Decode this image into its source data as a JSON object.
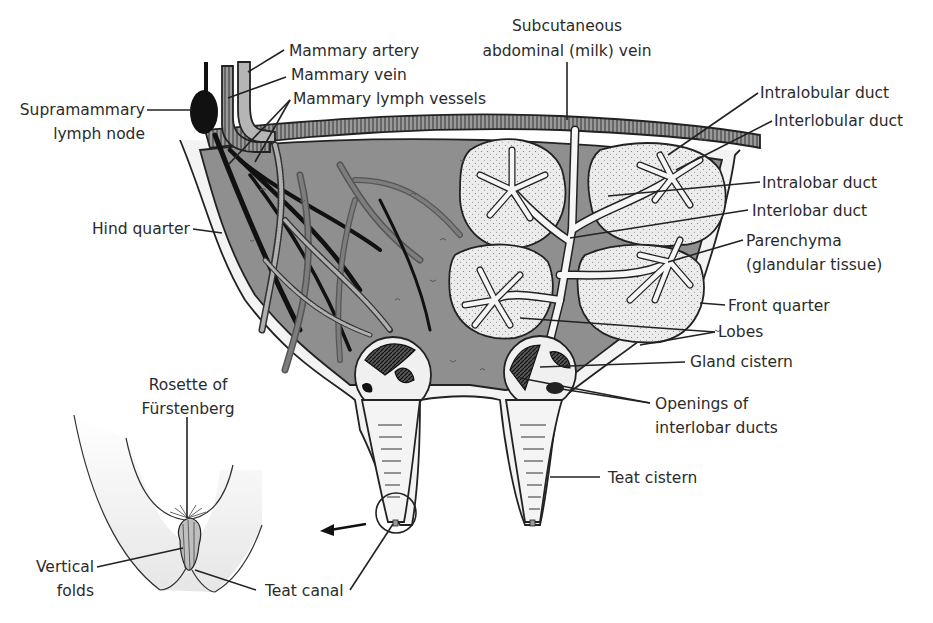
{
  "figure": {
    "colors": {
      "tissue_gray": "#8f8f8f",
      "lobe_fill": "#e8e8e8",
      "outline": "#222222",
      "teat_fill": "#f2f2f2",
      "background": "#ffffff"
    }
  },
  "labels": {
    "mammary_artery": "Mammary artery",
    "mammary_vein": "Mammary vein",
    "mammary_lymph_vessels": "Mammary lymph vessels",
    "supramammary_line1": "Supramammary",
    "supramammary_line2": "lymph node",
    "hind_quarter": "Hind quarter",
    "milk_vein_line1": "Subcutaneous",
    "milk_vein_line2": "abdominal (milk) vein",
    "intralobular_duct": "Intralobular duct",
    "interlobular_duct": "Interlobular duct",
    "intralobar_duct": "Intralobar duct",
    "interlobar_duct": "Interlobar duct",
    "parenchyma_line1": "Parenchyma",
    "parenchyma_line2": "(glandular tissue)",
    "front_quarter": "Front quarter",
    "lobes": "Lobes",
    "gland_cistern": "Gland cistern",
    "openings_line1": "Openings of",
    "openings_line2": "interlobar ducts",
    "teat_cistern": "Teat cistern",
    "rosette_line1": "Rosette of",
    "rosette_line2": "Fürstenberg",
    "vertical_folds_line1": "Vertical",
    "vertical_folds_line2": "folds",
    "teat_canal": "Teat canal"
  }
}
